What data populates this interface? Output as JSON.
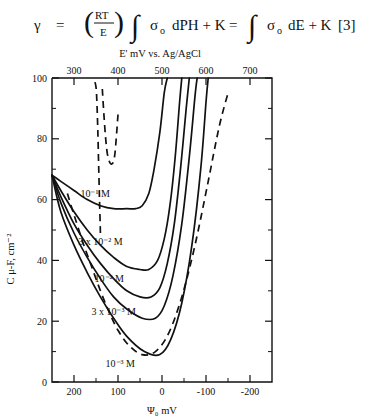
{
  "equation": {
    "lhs_symbol": "γ",
    "eq1": "=",
    "frac_num": "RT",
    "frac_den": "E",
    "paren_open": "(",
    "paren_close": ")",
    "integral": "∫",
    "sigma": "σ",
    "sigma_sub": "o",
    "term1": "dPH + K",
    "eq2": "=",
    "term2": "dE + K",
    "number": "[3]"
  },
  "chart_data": {
    "type": "line",
    "title": "",
    "xlabel": "Ψ₀ mV",
    "ylabel": "C μ-F, cm⁻²",
    "top_axis_label": "E' mV vs. Ag/AgCl",
    "xlim": [
      250,
      -250
    ],
    "ylim": [
      0,
      100
    ],
    "top_xlim": [
      250,
      750
    ],
    "grid": false,
    "legend": "inline-labels",
    "xticks": [
      200,
      100,
      0,
      -100,
      -200
    ],
    "xtick_labels": [
      "200",
      "100",
      "0",
      "-100",
      "-200"
    ],
    "yticks": [
      0,
      20,
      40,
      60,
      80,
      100
    ],
    "ytick_labels": [
      "0",
      "20",
      "40",
      "60",
      "80",
      "100"
    ],
    "top_xticks": [
      300,
      400,
      500,
      600,
      700
    ],
    "top_xtick_labels": [
      "300",
      "400",
      "500",
      "600",
      "700"
    ],
    "y_minor_interval": 10,
    "x_minor_interval": 50,
    "series": [
      {
        "name": "10-1-dashed",
        "label": "10⁻¹",
        "style": "dashed",
        "label_x": 180,
        "label_y": 120,
        "comment": "upper dashed U-shaped curve, minimum near C=72",
        "points": [
          [
            140,
            49
          ],
          [
            142,
            60
          ],
          [
            144,
            72
          ],
          [
            146,
            83
          ],
          [
            148,
            92
          ],
          [
            150,
            97
          ],
          [
            155,
            100
          ],
          [
            100,
            88
          ],
          [
            104,
            80
          ],
          [
            108,
            74
          ],
          [
            112,
            72
          ],
          [
            118,
            72
          ],
          [
            124,
            75
          ],
          [
            128,
            80
          ],
          [
            132,
            88
          ],
          [
            136,
            97
          ]
        ]
      },
      {
        "name": "10-1-M",
        "label": "10⁻¹ M",
        "style": "solid",
        "label_x": 152,
        "label_y": 61,
        "minimum": {
          "psi": 60,
          "C": 57
        },
        "points": [
          [
            250,
            68
          ],
          [
            230,
            66
          ],
          [
            200,
            63
          ],
          [
            170,
            60
          ],
          [
            140,
            58
          ],
          [
            110,
            57
          ],
          [
            80,
            57
          ],
          [
            60,
            57
          ],
          [
            45,
            58
          ],
          [
            30,
            62
          ],
          [
            18,
            70
          ],
          [
            5,
            82
          ],
          [
            -5,
            95
          ],
          [
            -12,
            100
          ]
        ]
      },
      {
        "name": "3x10-2-M",
        "label": "3 x 10⁻² M",
        "style": "solid",
        "label_x": 140,
        "label_y": 45,
        "minimum": {
          "psi": 20,
          "C": 37
        },
        "points": [
          [
            250,
            68
          ],
          [
            230,
            63
          ],
          [
            200,
            56
          ],
          [
            170,
            50
          ],
          [
            140,
            45
          ],
          [
            110,
            41
          ],
          [
            80,
            38
          ],
          [
            50,
            37
          ],
          [
            30,
            37
          ],
          [
            10,
            40
          ],
          [
            -5,
            47
          ],
          [
            -18,
            58
          ],
          [
            -30,
            74
          ],
          [
            -40,
            92
          ],
          [
            -45,
            100
          ]
        ]
      },
      {
        "name": "10-2-M",
        "label": "10⁻² M",
        "style": "solid",
        "label_x": 120,
        "label_y": 33,
        "minimum": {
          "psi": 10,
          "C": 28
        },
        "points": [
          [
            250,
            68
          ],
          [
            230,
            61
          ],
          [
            200,
            52
          ],
          [
            170,
            45
          ],
          [
            140,
            39
          ],
          [
            110,
            34
          ],
          [
            80,
            30
          ],
          [
            50,
            28
          ],
          [
            25,
            28
          ],
          [
            5,
            31
          ],
          [
            -12,
            39
          ],
          [
            -28,
            52
          ],
          [
            -42,
            70
          ],
          [
            -55,
            90
          ],
          [
            -62,
            100
          ]
        ]
      },
      {
        "name": "3x10-3-M",
        "label": "3 x 10⁻³ M",
        "style": "solid",
        "label_x": 110,
        "label_y": 22,
        "minimum": {
          "psi": 5,
          "C": 21
        },
        "points": [
          [
            250,
            68
          ],
          [
            230,
            59
          ],
          [
            200,
            49
          ],
          [
            170,
            41
          ],
          [
            140,
            34
          ],
          [
            110,
            28
          ],
          [
            80,
            24
          ],
          [
            45,
            21
          ],
          [
            15,
            21
          ],
          [
            -5,
            25
          ],
          [
            -25,
            35
          ],
          [
            -45,
            52
          ],
          [
            -62,
            74
          ],
          [
            -75,
            94
          ],
          [
            -80,
            100
          ]
        ]
      },
      {
        "name": "10-3-M",
        "label": "10⁻³ M",
        "style": "solid",
        "label_x": 95,
        "label_y": 5,
        "minimum": {
          "psi": 0,
          "C": 9
        },
        "points": [
          [
            250,
            68
          ],
          [
            230,
            56
          ],
          [
            200,
            45
          ],
          [
            170,
            36
          ],
          [
            140,
            28
          ],
          [
            110,
            21
          ],
          [
            80,
            15
          ],
          [
            40,
            10
          ],
          [
            5,
            9
          ],
          [
            -20,
            14
          ],
          [
            -45,
            26
          ],
          [
            -68,
            45
          ],
          [
            -88,
            70
          ],
          [
            -100,
            92
          ],
          [
            -105,
            100
          ]
        ]
      },
      {
        "name": "outer-dashed",
        "label": "",
        "style": "dashed",
        "comment": "lower-left to right outer dashed envelope crossing the family",
        "points": [
          [
            215,
            62
          ],
          [
            200,
            55
          ],
          [
            180,
            46
          ],
          [
            160,
            38
          ],
          [
            140,
            30
          ],
          [
            120,
            23
          ],
          [
            100,
            17
          ],
          [
            75,
            12
          ],
          [
            45,
            9
          ],
          [
            15,
            10
          ],
          [
            -15,
            16
          ],
          [
            -45,
            28
          ],
          [
            -75,
            45
          ],
          [
            -105,
            66
          ],
          [
            -130,
            84
          ],
          [
            -150,
            95
          ]
        ]
      }
    ]
  }
}
